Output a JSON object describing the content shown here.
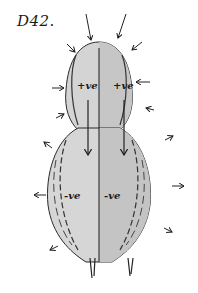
{
  "diagram": {
    "title": "D42.",
    "regions": {
      "upper_left_charge": "+ve",
      "upper_right_charge": "+ve",
      "lower_left_charge": "-ve",
      "lower_right_charge": "-ve"
    },
    "colors": {
      "ink": "#1a1a1a",
      "fill_light": "#d6d6d6",
      "fill_dark": "#bdbdbd",
      "background": "#ffffff"
    }
  }
}
